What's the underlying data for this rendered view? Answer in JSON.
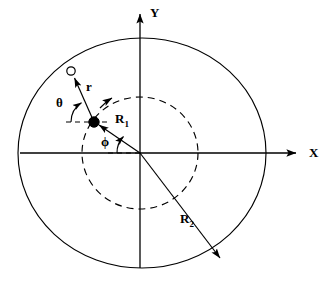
{
  "figure": {
    "type": "geometry-diagram",
    "background_color": "#ffffff",
    "stroke_color": "#000000"
  },
  "axes": {
    "x_label": "X",
    "y_label": "Y",
    "origin": {
      "x": 140,
      "y": 153
    },
    "x_axis_tip": {
      "x": 300,
      "y": 153
    },
    "y_axis_tip": {
      "x": 140,
      "y": 10
    }
  },
  "circles": {
    "outer": {
      "name": "R2",
      "label": "R",
      "subscript": "2",
      "style": "solid",
      "rx": 124,
      "ry": 115,
      "cx": 142,
      "cy": 153
    },
    "inner": {
      "name": "R1",
      "label": "R",
      "subscript": "1",
      "style": "dashed",
      "rx": 58,
      "ry": 56,
      "cx": 140,
      "cy": 153
    }
  },
  "vectors": {
    "r": {
      "label": "r",
      "from": {
        "x": 94,
        "y": 122
      },
      "to": {
        "x": 73,
        "y": 75
      },
      "arrowhead": "to",
      "label_pos": {
        "x": 88,
        "y": 86
      }
    },
    "R1": {
      "label": "R",
      "subscript": "1",
      "from": {
        "x": 140,
        "y": 153
      },
      "to": {
        "x": 94,
        "y": 122
      },
      "arrowhead": "to",
      "label_pos": {
        "x": 117,
        "y": 118
      }
    },
    "R2": {
      "label": "R",
      "subscript": "2",
      "from": {
        "x": 140,
        "y": 153
      },
      "to": {
        "x": 222,
        "y": 261
      },
      "arrowhead": "to",
      "label_pos": {
        "x": 182,
        "y": 219
      }
    }
  },
  "angles": {
    "theta": {
      "label": "θ",
      "vertex": {
        "x": 94,
        "y": 122
      },
      "reference": "dashed horizontal to the left of the source point",
      "label_pos": {
        "x": 58,
        "y": 96
      }
    },
    "phi": {
      "label": "ϕ",
      "vertex": {
        "x": 140,
        "y": 153
      },
      "reference": "dashed horizontal to the left of the origin",
      "label_pos": {
        "x": 102,
        "y": 136
      }
    }
  },
  "markers": {
    "source_point": {
      "name": "filled-dot",
      "x": 94,
      "y": 122,
      "radius": 5,
      "fill": "#000000"
    },
    "field_point": {
      "name": "open-circle",
      "x": 71,
      "y": 71,
      "radius": 4,
      "fill": "#ffffff"
    },
    "orbit_arrow": {
      "name": "counterclockwise-arrow",
      "x": 114,
      "y": 96
    }
  }
}
